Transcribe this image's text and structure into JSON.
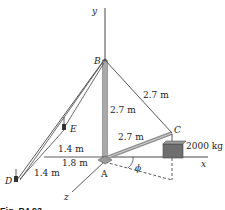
{
  "figure": {
    "axes": {
      "x": "x",
      "y": "y",
      "z": "z"
    },
    "points": {
      "A": "A",
      "B": "B",
      "C": "C",
      "D": "D",
      "E": "E"
    },
    "angle_label": "ϕ",
    "dimensions": {
      "AB": "2.7 m",
      "BC": "2.7 m",
      "AC": "2.7 m",
      "E_offset": "1.4 m",
      "D_offset": "1.4 m",
      "A_to_origin_x": "1.8 m"
    },
    "load": "2000 kg",
    "caption": "Fig. P4.93"
  }
}
